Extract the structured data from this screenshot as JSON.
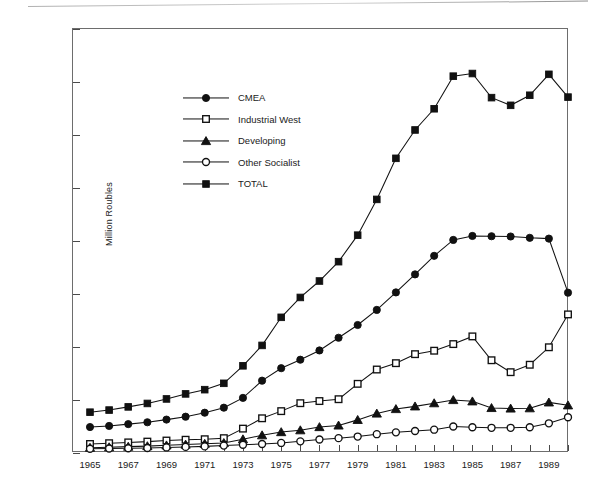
{
  "chart_data": {
    "type": "line",
    "title": "",
    "xlabel": "",
    "ylabel": "Million Roubles",
    "xlim": [
      1965,
      1990
    ],
    "ylim": [
      0,
      160000
    ],
    "ytick_step": 20000,
    "xtick_step": 1,
    "xlabel_step": 2,
    "grid": false,
    "legend_position": "upper-left-inside",
    "y_ticks": [
      "0",
      "20000",
      "40000",
      "60000",
      "80000",
      "100000",
      "120000",
      "140000",
      "160000"
    ],
    "x_ticks": [
      "1965",
      "1967",
      "1969",
      "1971",
      "1973",
      "1975",
      "1977",
      "1979",
      "1981",
      "1983",
      "1985",
      "1987",
      "1989"
    ],
    "x_tick_values": [
      1965,
      1967,
      1969,
      1971,
      1973,
      1975,
      1977,
      1979,
      1981,
      1983,
      1985,
      1987,
      1989
    ],
    "x": [
      1965,
      1966,
      1967,
      1968,
      1969,
      1970,
      1971,
      1972,
      1973,
      1974,
      1975,
      1976,
      1977,
      1978,
      1979,
      1980,
      1981,
      1982,
      1983,
      1984,
      1985,
      1986,
      1987,
      1988,
      1989,
      1990
    ],
    "series": [
      {
        "name": "CMEA",
        "marker": "filled-circle",
        "color": "#111111",
        "values": [
          9800,
          10200,
          10900,
          11600,
          12600,
          13700,
          15200,
          17100,
          20800,
          27300,
          32000,
          35200,
          38700,
          43500,
          48300,
          54000,
          60600,
          67400,
          74400,
          80400,
          81900,
          81800,
          81700,
          81200,
          80900,
          60500
        ]
      },
      {
        "name": "Industrial West",
        "marker": "open-square",
        "color": "#111111",
        "values": [
          3400,
          3700,
          4000,
          4300,
          4700,
          5000,
          5200,
          5600,
          9200,
          13100,
          15800,
          18800,
          19600,
          20300,
          26100,
          31500,
          33900,
          37300,
          38600,
          41100,
          44000,
          35000,
          30500,
          33300,
          39900,
          52300
        ]
      },
      {
        "name": "Developing",
        "marker": "filled-triangle",
        "color": "#111111",
        "values": [
          2000,
          2200,
          2400,
          2600,
          2900,
          3200,
          3500,
          3800,
          5200,
          6700,
          7900,
          8600,
          9800,
          10400,
          12500,
          14900,
          16600,
          17600,
          18800,
          20000,
          19500,
          17000,
          16800,
          16900,
          19100,
          18000
        ]
      },
      {
        "name": "Other Socialist",
        "marker": "open-circle",
        "values": [
          1600,
          1700,
          1800,
          1900,
          2100,
          2300,
          2500,
          2800,
          3100,
          3400,
          3800,
          4400,
          5100,
          5600,
          6200,
          7100,
          7800,
          8300,
          8800,
          10000,
          9700,
          9500,
          9500,
          9700,
          11200,
          13500
        ]
      },
      {
        "name": "TOTAL",
        "marker": "filled-square",
        "color": "#111111",
        "values": [
          15400,
          16200,
          17400,
          18700,
          20400,
          22300,
          23900,
          26300,
          32900,
          40600,
          51200,
          58700,
          64900,
          72200,
          82200,
          95700,
          111200,
          121900,
          129900,
          142200,
          143200,
          134100,
          131200,
          135000,
          142900,
          134300
        ]
      }
    ]
  },
  "legend": {
    "items": [
      {
        "label": "CMEA",
        "marker": "filled-circle"
      },
      {
        "label": "Industrial West",
        "marker": "open-square"
      },
      {
        "label": "Developing",
        "marker": "filled-triangle"
      },
      {
        "label": "Other Socialist",
        "marker": "open-circle"
      },
      {
        "label": "TOTAL",
        "marker": "filled-square"
      }
    ]
  }
}
